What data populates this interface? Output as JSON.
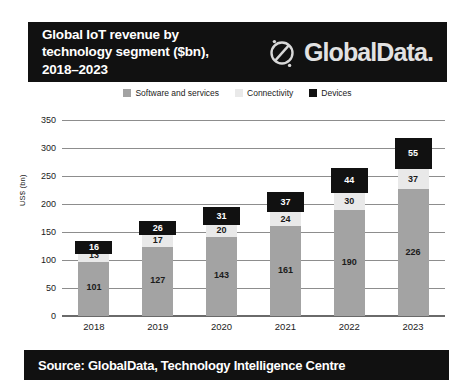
{
  "header": {
    "title": "Global IoT revenue by\ntechnology segment ($bn),\n2018–2023",
    "brand_name": "GlobalData.",
    "brand_mark": "globaldata-circle-logo-icon"
  },
  "footer": {
    "source_text": "Source: GlobalData, Technology Intelligence Centre"
  },
  "chart_data": {
    "type": "bar",
    "subtype": "stacked",
    "title": "Global IoT revenue by technology segment ($bn), 2018–2023",
    "xlabel": "",
    "ylabel": "US$ (bn)",
    "categories": [
      "2018",
      "2019",
      "2020",
      "2021",
      "2022",
      "2023"
    ],
    "series": [
      {
        "name": "Software and services",
        "color": "#a3a3a3",
        "values": [
          101,
          127,
          143,
          161,
          190,
          226
        ]
      },
      {
        "name": "Connectivity",
        "color": "#e9e9e9",
        "values": [
          13,
          17,
          20,
          24,
          30,
          37
        ]
      },
      {
        "name": "Devices",
        "color": "#111111",
        "values": [
          16,
          26,
          31,
          37,
          44,
          55
        ]
      }
    ],
    "totals": [
      130,
      170,
      194,
      222,
      264,
      318
    ],
    "ylim": [
      0,
      350
    ],
    "yticks": [
      0,
      50,
      100,
      150,
      200,
      250,
      300,
      350
    ],
    "ytick_labels": [
      "0",
      "50",
      "100",
      "150",
      "200",
      "250",
      "300",
      "350"
    ],
    "grid": true,
    "legend_position": "top"
  },
  "legend": [
    {
      "label": "Software and services",
      "color": "#a3a3a3"
    },
    {
      "label": "Connectivity",
      "color": "#e9e9e9"
    },
    {
      "label": "Devices",
      "color": "#111111"
    }
  ]
}
